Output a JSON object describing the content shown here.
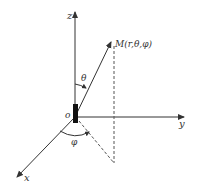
{
  "diagram": {
    "colors": {
      "stroke": "#333333",
      "dashed": "#555555",
      "background": "#ffffff"
    },
    "axes": {
      "z": {
        "label": "z"
      },
      "y": {
        "label": "y"
      },
      "x": {
        "label": "x"
      }
    },
    "origin": {
      "label": "o"
    },
    "point": {
      "label": "M(r,θ,φ)"
    },
    "angles": {
      "theta": {
        "label": "θ"
      },
      "phi": {
        "label": "φ"
      }
    }
  }
}
